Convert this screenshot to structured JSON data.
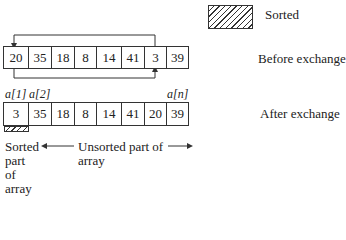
{
  "legend": {
    "label": "Sorted",
    "pattern": "hatched"
  },
  "before": {
    "label": "Before exchange",
    "cells": [
      "20",
      "35",
      "18",
      "8",
      "14",
      "41",
      "3",
      "39"
    ],
    "exchange_indices": [
      0,
      6
    ]
  },
  "after": {
    "label": "After exchange",
    "cells": [
      "3",
      "35",
      "18",
      "8",
      "14",
      "41",
      "20",
      "39"
    ],
    "index_labels": {
      "first": "a[1]",
      "second": "a[2]",
      "last": "a[n]"
    }
  },
  "annotations": {
    "sorted_part": "Sorted part of array",
    "sorted_lines": [
      "Sorted",
      "part",
      "of",
      "array"
    ],
    "unsorted_line1": "Unsorted part of",
    "unsorted_line2": "array"
  }
}
